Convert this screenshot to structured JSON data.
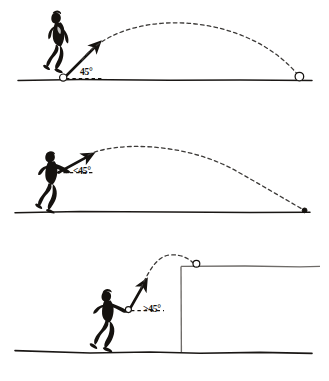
{
  "figure": {
    "background_color": "#ffffff",
    "ink_color": "#15120f",
    "trajectory_color": "#3c3a38",
    "ground_color": "#1a1715",
    "platform_color": "#6e6b68"
  },
  "panels": [
    {
      "id": "panel-1",
      "index": 1,
      "angle_label": "45°",
      "angle_value": 45,
      "comparator": "=",
      "thrower_pose": "bowling-underarm-run",
      "launch_point": {
        "x": 63,
        "y": 78
      },
      "landing_point": {
        "x": 299,
        "y": 78
      },
      "apex_point": {
        "x": 181,
        "y": 20
      },
      "range_px": 236,
      "apex_height_px": 58,
      "trajectory_style": "dashed",
      "trajectory_symmetry": "symmetric",
      "ball_at_launch": true,
      "ball_at_landing": true,
      "ground": {
        "y": 80,
        "x_start": 18,
        "x_end": 312
      },
      "platform": null,
      "description": "Launch at 45 degrees gives the maximum horizontal range on level ground."
    },
    {
      "id": "panel-2",
      "index": 2,
      "angle_label": "<45°",
      "angle_value": 45,
      "comparator": "<",
      "thrower_pose": "overarm-throw-low",
      "launch_point": {
        "x": 62,
        "y": 172
      },
      "landing_point": {
        "x": 304,
        "y": 211
      },
      "apex_point": {
        "x": 150,
        "y": 150
      },
      "range_px": 242,
      "apex_height_px": 61,
      "trajectory_style": "dashed",
      "trajectory_symmetry": "flat-early-apex",
      "ball_at_launch": false,
      "ball_at_landing": true,
      "ground": {
        "y": 212,
        "x_start": 15,
        "x_end": 310
      },
      "platform": null,
      "description": "A flatter launch angle below 45 degrees falls short of the maximum range."
    },
    {
      "id": "panel-3",
      "index": 3,
      "angle_label": ">45°",
      "angle_value": 45,
      "comparator": ">",
      "thrower_pose": "standing-throw-high",
      "launch_point": {
        "x": 128,
        "y": 310
      },
      "landing_point": {
        "x": 196,
        "y": 266
      },
      "apex_point": {
        "x": 168,
        "y": 256
      },
      "range_px": 68,
      "apex_height_px": 54,
      "trajectory_style": "dashed",
      "trajectory_symmetry": "steep-high-arc",
      "ball_at_launch": true,
      "ball_at_landing": true,
      "ground": {
        "y": 352,
        "x_start": 15,
        "x_end": 312
      },
      "platform": {
        "wall_x": 181,
        "top_y": 266,
        "right_x": 320,
        "base_y": 352
      },
      "description": "A steeper launch angle above 45 degrees clears a raised wall but travels less far."
    }
  ],
  "icons": {
    "arrow": "velocity-arrow-icon",
    "ball": "ball-icon",
    "dashed_baseline": "horizontal-reference-dashes"
  }
}
